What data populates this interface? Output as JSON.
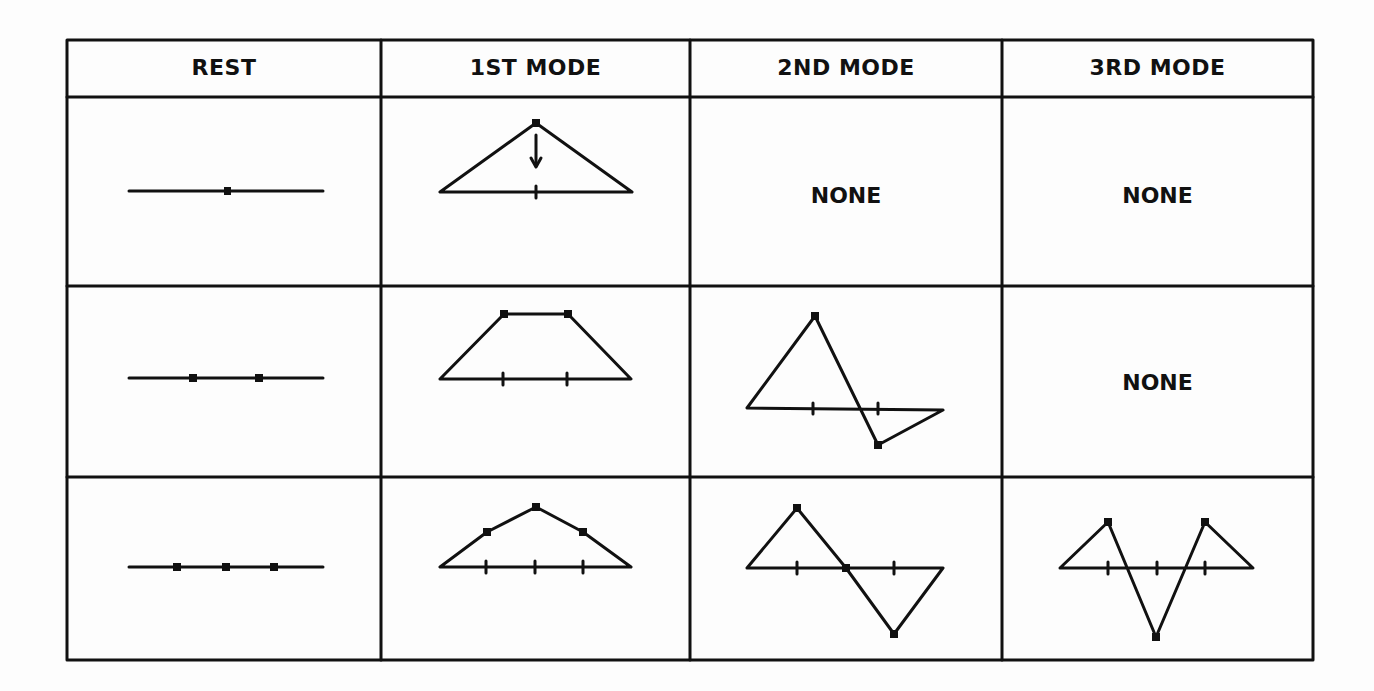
{
  "table": {
    "headers": [
      "REST",
      "1ST MODE",
      "2ND MODE",
      "3RD MODE"
    ],
    "rows": [
      {
        "masses": 1,
        "rest": "1 mass",
        "mode1": "triangle",
        "mode2": "NONE",
        "mode3": "NONE"
      },
      {
        "masses": 2,
        "rest": "2 masses",
        "mode1": "trapezoid",
        "mode2": "antisymmetric",
        "mode3": "NONE"
      },
      {
        "masses": 3,
        "rest": "3 masses",
        "mode1": "arched",
        "mode2": "antisymmetric",
        "mode3": "W-shape"
      }
    ],
    "none_label": "NONE"
  }
}
